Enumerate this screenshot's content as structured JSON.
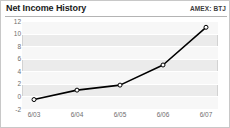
{
  "header": {
    "title": "Net Income History",
    "ticker": "AMEX: BTJ"
  },
  "chart_data": {
    "type": "line",
    "title": "Net Income History",
    "subtitle": "AMEX: BTJ",
    "xlabel": "",
    "ylabel": "",
    "categories": [
      "6/03",
      "6/04",
      "6/05",
      "6/06",
      "6/07"
    ],
    "values": [
      -0.5,
      1.0,
      1.8,
      5.0,
      11.0
    ],
    "series": [
      {
        "name": "Net Income",
        "values": [
          -0.5,
          1.0,
          1.8,
          5.0,
          11.0
        ]
      }
    ],
    "yticks": [
      12,
      10,
      8,
      6,
      4,
      2,
      0,
      -2
    ],
    "ylim": [
      -2,
      12
    ],
    "xticklabels": [
      "6/03",
      "6/04",
      "6/05",
      "6/06",
      "6/07"
    ],
    "grid": true,
    "legend": false,
    "line_color": "#000000",
    "marker": "open-circle",
    "plot_background": "#ebebeb",
    "band_color": "#f7f7f7",
    "gridline_color": "#ffffff"
  }
}
